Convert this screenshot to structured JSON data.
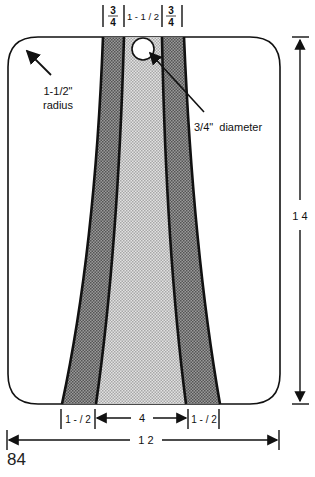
{
  "diagram": {
    "type": "dimensioned-pattern",
    "top_dimensions": {
      "left_stripe_width": {
        "num": "3",
        "den": "4"
      },
      "center_width": "1 - 1 / 2",
      "right_stripe_width": {
        "num": "3",
        "den": "4"
      }
    },
    "corner_callout": {
      "line1": "1-1/2\"",
      "line2": "radius"
    },
    "hole_callout": "3/4\"  diameter",
    "height_label": "1 4",
    "bottom_dimensions": {
      "left_stripe_width": "1 - / 2",
      "center_width": "4",
      "right_stripe_width": "1 - / 2"
    },
    "overall_width_label": "1 2",
    "colors": {
      "outline": "#111111",
      "outer_stripe_fill": "#8a8a8a",
      "center_fill": "#cfcfcf",
      "background": "#ffffff"
    }
  },
  "page_number": "84"
}
